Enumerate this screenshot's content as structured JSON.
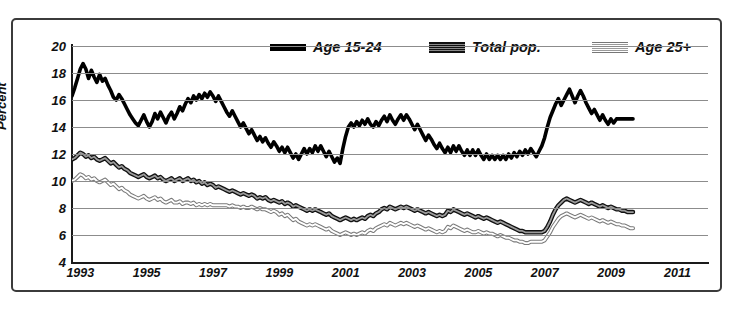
{
  "chart_data": {
    "type": "line",
    "title": "",
    "xlabel": "",
    "ylabel": "Percent",
    "ylim": [
      4,
      20
    ],
    "ytick_values": [
      20,
      18,
      16,
      14,
      12,
      10,
      8,
      6,
      4
    ],
    "xlim": [
      1992.75,
      2011.92
    ],
    "xtick_values": [
      1993,
      1995,
      1997,
      1999,
      2001,
      2003,
      2005,
      2007,
      2009,
      2011
    ],
    "xtick_labels": [
      "1993",
      "1995",
      "1997",
      "1999",
      "2001",
      "2003",
      "2005",
      "2007",
      "2009",
      "2011"
    ],
    "grid": "horizontal",
    "legend_position": "top-center",
    "x_start": 1992.75,
    "x_step": 0.0833,
    "series": [
      {
        "name": "Age 15-24",
        "style": "solid-black",
        "color": "#000000",
        "values": [
          16.3,
          16.9,
          17.6,
          18.3,
          18.7,
          18.3,
          17.6,
          18.2,
          17.7,
          17.3,
          17.9,
          17.4,
          17.6,
          17.1,
          16.7,
          16.2,
          16.0,
          16.4,
          16.1,
          15.7,
          15.3,
          14.9,
          14.6,
          14.3,
          14.1,
          14.5,
          14.9,
          14.4,
          14.0,
          14.4,
          15.0,
          14.6,
          15.1,
          14.7,
          14.3,
          14.8,
          15.1,
          14.6,
          15.0,
          15.5,
          15.2,
          15.7,
          16.1,
          15.8,
          16.3,
          16.0,
          16.4,
          16.1,
          16.5,
          16.2,
          16.6,
          16.3,
          15.9,
          16.3,
          15.9,
          15.5,
          15.1,
          14.8,
          15.2,
          14.8,
          14.4,
          14.0,
          14.3,
          13.9,
          13.5,
          13.8,
          13.4,
          13.0,
          13.3,
          12.9,
          13.2,
          12.8,
          12.5,
          12.9,
          12.6,
          12.2,
          12.5,
          12.1,
          12.5,
          12.1,
          11.7,
          12.0,
          11.6,
          12.0,
          12.4,
          12.0,
          12.4,
          12.1,
          12.6,
          12.2,
          12.6,
          12.2,
          11.8,
          12.2,
          11.8,
          11.4,
          11.7,
          11.3,
          12.4,
          13.3,
          14.0,
          14.3,
          14.0,
          14.4,
          14.1,
          14.5,
          14.2,
          14.6,
          14.2,
          14.0,
          14.4,
          14.1,
          14.5,
          14.8,
          14.4,
          14.9,
          14.5,
          14.2,
          14.6,
          14.9,
          14.5,
          14.9,
          14.6,
          14.2,
          13.8,
          14.2,
          13.8,
          13.4,
          13.0,
          13.4,
          13.1,
          12.7,
          12.4,
          12.8,
          12.4,
          12.1,
          12.5,
          12.1,
          12.6,
          12.2,
          12.6,
          12.2,
          11.9,
          12.3,
          11.9,
          12.3,
          11.9,
          12.3,
          11.9,
          11.6,
          12.0,
          11.6,
          11.9,
          11.6,
          11.9,
          11.6,
          11.9,
          11.6,
          12.0,
          11.7,
          12.1,
          11.8,
          12.2,
          11.9,
          12.3,
          12.0,
          12.4,
          12.1,
          11.8,
          12.2,
          12.6,
          13.2,
          14.0,
          14.7,
          15.2,
          15.7,
          16.1,
          15.6,
          16.0,
          16.4,
          16.8,
          16.3,
          15.8,
          16.3,
          16.7,
          16.3,
          15.8,
          15.4,
          15.0,
          15.3,
          14.9,
          14.5,
          14.9,
          14.5,
          14.2,
          14.6,
          14.3,
          14.6,
          14.6,
          14.6,
          14.6,
          14.6,
          14.6,
          14.6
        ]
      },
      {
        "name": "Total pop.",
        "style": "dark-hatched",
        "color": "#111111",
        "values": [
          11.6,
          11.7,
          11.9,
          12.1,
          12.0,
          11.8,
          11.9,
          11.7,
          11.8,
          11.6,
          11.5,
          11.6,
          11.7,
          11.5,
          11.3,
          11.4,
          11.2,
          11.0,
          11.1,
          10.9,
          10.8,
          10.6,
          10.5,
          10.4,
          10.3,
          10.4,
          10.5,
          10.3,
          10.2,
          10.3,
          10.4,
          10.2,
          10.3,
          10.1,
          10.0,
          10.1,
          10.2,
          10.0,
          10.1,
          10.2,
          10.0,
          10.1,
          10.2,
          10.0,
          10.1,
          9.9,
          10.0,
          9.8,
          9.9,
          9.7,
          9.8,
          9.7,
          9.5,
          9.6,
          9.5,
          9.4,
          9.3,
          9.2,
          9.3,
          9.2,
          9.1,
          9.0,
          9.1,
          9.0,
          8.9,
          9.0,
          8.9,
          8.7,
          8.8,
          8.7,
          8.8,
          8.6,
          8.5,
          8.6,
          8.5,
          8.4,
          8.5,
          8.3,
          8.4,
          8.3,
          8.1,
          8.2,
          8.1,
          8.0,
          7.9,
          7.8,
          7.9,
          7.8,
          7.9,
          7.8,
          7.7,
          7.6,
          7.5,
          7.6,
          7.4,
          7.3,
          7.2,
          7.1,
          7.2,
          7.3,
          7.2,
          7.1,
          7.2,
          7.1,
          7.2,
          7.3,
          7.2,
          7.4,
          7.5,
          7.4,
          7.6,
          7.7,
          7.9,
          8.0,
          7.9,
          8.1,
          8.0,
          7.9,
          8.0,
          8.1,
          8.0,
          8.1,
          8.0,
          7.9,
          7.8,
          7.9,
          7.8,
          7.7,
          7.6,
          7.7,
          7.6,
          7.5,
          7.4,
          7.5,
          7.4,
          7.5,
          7.8,
          7.7,
          7.9,
          7.8,
          7.7,
          7.6,
          7.5,
          7.6,
          7.5,
          7.4,
          7.3,
          7.4,
          7.3,
          7.2,
          7.3,
          7.2,
          7.1,
          7.0,
          6.9,
          7.0,
          6.9,
          6.8,
          6.7,
          6.6,
          6.5,
          6.4,
          6.3,
          6.3,
          6.2,
          6.2,
          6.2,
          6.2,
          6.2,
          6.2,
          6.2,
          6.3,
          6.6,
          7.0,
          7.5,
          7.9,
          8.2,
          8.4,
          8.6,
          8.7,
          8.6,
          8.5,
          8.4,
          8.5,
          8.6,
          8.5,
          8.4,
          8.3,
          8.4,
          8.3,
          8.2,
          8.1,
          8.2,
          8.1,
          8.0,
          8.1,
          8.0,
          7.9,
          7.9,
          7.8,
          7.8,
          7.7,
          7.7,
          7.7
        ]
      },
      {
        "name": "Age 25+",
        "style": "light-outline",
        "color": "#7a7a7a",
        "values": [
          10.0,
          10.1,
          10.3,
          10.5,
          10.4,
          10.2,
          10.3,
          10.1,
          10.2,
          10.0,
          9.9,
          10.0,
          10.1,
          9.9,
          9.7,
          9.8,
          9.6,
          9.4,
          9.5,
          9.3,
          9.2,
          9.0,
          8.9,
          8.8,
          8.7,
          8.8,
          8.9,
          8.7,
          8.6,
          8.7,
          8.8,
          8.6,
          8.7,
          8.5,
          8.4,
          8.5,
          8.6,
          8.4,
          8.4,
          8.5,
          8.3,
          8.4,
          8.4,
          8.3,
          8.4,
          8.2,
          8.3,
          8.2,
          8.3,
          8.2,
          8.3,
          8.2,
          8.2,
          8.2,
          8.2,
          8.2,
          8.2,
          8.1,
          8.2,
          8.1,
          8.1,
          8.0,
          8.1,
          8.0,
          8.0,
          8.1,
          8.0,
          7.9,
          8.0,
          7.9,
          7.9,
          7.8,
          7.7,
          7.8,
          7.7,
          7.5,
          7.6,
          7.4,
          7.5,
          7.3,
          7.1,
          7.2,
          7.0,
          6.9,
          6.8,
          6.7,
          6.8,
          6.7,
          6.8,
          6.7,
          6.6,
          6.5,
          6.4,
          6.5,
          6.3,
          6.2,
          6.1,
          6.0,
          6.1,
          6.2,
          6.1,
          6.0,
          6.1,
          6.0,
          6.1,
          6.2,
          6.1,
          6.3,
          6.4,
          6.3,
          6.5,
          6.6,
          6.7,
          6.8,
          6.7,
          6.9,
          6.8,
          6.7,
          6.8,
          6.9,
          6.8,
          6.9,
          6.8,
          6.7,
          6.6,
          6.7,
          6.6,
          6.5,
          6.4,
          6.5,
          6.4,
          6.3,
          6.2,
          6.3,
          6.2,
          6.3,
          6.6,
          6.5,
          6.7,
          6.6,
          6.5,
          6.4,
          6.3,
          6.4,
          6.3,
          6.2,
          6.2,
          6.3,
          6.2,
          6.1,
          6.2,
          6.1,
          6.1,
          6.0,
          5.9,
          6.0,
          5.9,
          5.8,
          5.8,
          5.7,
          5.6,
          5.6,
          5.5,
          5.5,
          5.4,
          5.4,
          5.5,
          5.5,
          5.5,
          5.5,
          5.5,
          5.6,
          5.9,
          6.2,
          6.6,
          6.9,
          7.2,
          7.4,
          7.5,
          7.6,
          7.5,
          7.4,
          7.3,
          7.4,
          7.5,
          7.4,
          7.3,
          7.2,
          7.3,
          7.2,
          7.1,
          7.0,
          7.1,
          7.0,
          6.9,
          7.0,
          6.9,
          6.8,
          6.8,
          6.7,
          6.7,
          6.6,
          6.5,
          6.5
        ]
      }
    ]
  },
  "legend": {
    "items": [
      {
        "label": "Age 15-24",
        "swatch": "solid-black-line-icon"
      },
      {
        "label": "Total pop.",
        "swatch": "dark-hatched-line-icon"
      },
      {
        "label": "Age 25+",
        "swatch": "light-hatched-line-icon"
      }
    ]
  },
  "axes": {
    "y_title": "Percent",
    "y_ticks": [
      "20",
      "18",
      "16",
      "14",
      "12",
      "10",
      "8",
      "6",
      "4"
    ],
    "x_ticks": [
      "1993",
      "1995",
      "1997",
      "1999",
      "2001",
      "2003",
      "2005",
      "2007",
      "2009",
      "2011"
    ]
  },
  "colors": {
    "frame": "#3b3b3b",
    "grid": "#8c8c8c",
    "axis": "#1a1a1a",
    "series_young": "#000000",
    "series_total": "#111111",
    "series_older": "#7a7a7a",
    "background": "#ffffff"
  }
}
